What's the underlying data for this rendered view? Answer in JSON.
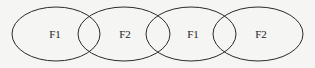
{
  "diagram": {
    "stroke_color": "#2a2a2a",
    "background": "#f5f5f4",
    "ellipses": [
      {
        "label": "F1",
        "cx": 56,
        "cy": 34,
        "rx": 44,
        "ry": 27
      },
      {
        "label": "F2",
        "cx": 124,
        "cy": 34,
        "rx": 46,
        "ry": 27
      },
      {
        "label": "F1",
        "cx": 191,
        "cy": 34,
        "rx": 45,
        "ry": 27
      },
      {
        "label": "F2",
        "cx": 258,
        "cy": 34,
        "rx": 45,
        "ry": 27
      }
    ]
  }
}
